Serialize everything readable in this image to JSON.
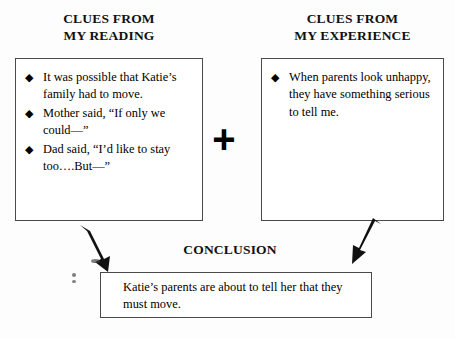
{
  "diagram": {
    "title_reading": "CLUES FROM\nMY READING",
    "title_experience": "CLUES FROM\nMY EXPERIENCE",
    "operator": "+",
    "conclusion_label": "CONCLUSION",
    "bullet_glyph": "◆",
    "reading_clues": [
      "It was possible that Katie’s family had to move.",
      "Mother said, “If only we could—”",
      "Dad said, “I’d like to stay too….But—”"
    ],
    "experience_clues": [
      "When parents look unhappy, they have something serious to tell me."
    ],
    "conclusion_text": "Katie’s parents are about to tell her that they must move.",
    "colors": {
      "background": "#fdfdfd",
      "ink": "#000000",
      "border": "#4a4a4a"
    }
  }
}
